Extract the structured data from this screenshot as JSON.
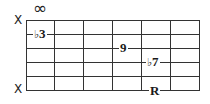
{
  "diagram": {
    "type": "guitar-chord-fretboard",
    "strings": 6,
    "frets": 6,
    "top_marker": "∞",
    "string_markers": [
      {
        "string": 1,
        "label": "X"
      },
      {
        "string": 6,
        "label": "X"
      }
    ],
    "notes": [
      {
        "string": 2,
        "fret": 1,
        "flat": "♭",
        "degree": "3"
      },
      {
        "string": 3,
        "fret": 4,
        "flat": "",
        "degree": "9"
      },
      {
        "string": 4,
        "fret": 5,
        "flat": "♭",
        "degree": "7"
      },
      {
        "string": 6,
        "fret": 5,
        "flat": "",
        "degree": "R"
      }
    ],
    "colors": {
      "lines": "#333333",
      "text": "#1a1a1a",
      "background": "#ffffff"
    }
  }
}
